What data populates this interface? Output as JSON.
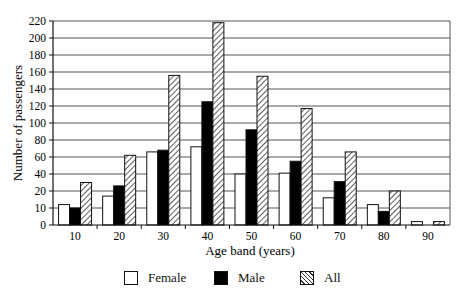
{
  "chart_data": {
    "type": "bar",
    "title": "",
    "xlabel": "Age band (years)",
    "ylabel": "Number of passengers",
    "categories": [
      "10",
      "20",
      "30",
      "40",
      "50",
      "60",
      "70",
      "80",
      "90"
    ],
    "series": [
      {
        "name": "Female",
        "fill": "white",
        "values": [
          12,
          17,
          66,
          72,
          40,
          41,
          16,
          12,
          2
        ]
      },
      {
        "name": "Male",
        "fill": "black",
        "values": [
          10,
          26,
          68,
          125,
          92,
          55,
          31,
          8,
          0
        ]
      },
      {
        "name": "All",
        "fill": "hatched",
        "values": [
          30,
          62,
          156,
          218,
          155,
          117,
          66,
          20,
          2
        ]
      }
    ],
    "yticks": [
      0,
      10,
      20,
      40,
      60,
      80,
      100,
      120,
      140,
      160,
      180,
      200,
      220
    ],
    "ylim": [
      0,
      220
    ],
    "grid": true,
    "legend_position": "bottom"
  },
  "legend": {
    "female": "Female",
    "male": "Male",
    "all": "All"
  }
}
